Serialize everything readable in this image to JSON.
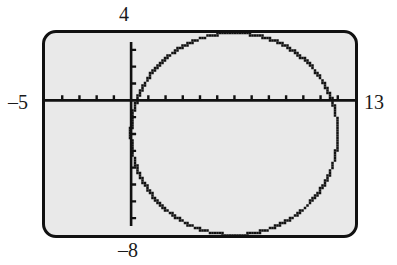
{
  "figure": {
    "kind": "graphing-calculator-screen",
    "screen": {
      "background_color": "#e9e9e9",
      "border_color": "#111111"
    }
  },
  "axis_labels": {
    "xmin": "–5",
    "xmax": "13",
    "ymax": "4",
    "ymin": "–8"
  },
  "chart_data": {
    "type": "scatter",
    "title": "",
    "xlabel": "",
    "ylabel": "",
    "xlim": [
      -5,
      13
    ],
    "ylim": [
      -8,
      4
    ],
    "xtick_step": 1,
    "ytick_step": 1,
    "grid": false,
    "legend": null,
    "axes": {
      "x_axis_at_y": 0,
      "y_axis_at_x": 0,
      "tick_marks": true,
      "tick_length_px": 5
    },
    "series": [
      {
        "name": "circle",
        "type": "circle",
        "center": [
          6,
          -2
        ],
        "radius": 6,
        "stroke": "#111111",
        "rendering": "pixelated-dotted",
        "x_intercepts": [
          0.34,
          11.66
        ],
        "y_intercepts": [
          -2
        ],
        "top_point": [
          6,
          4
        ],
        "bottom_point": [
          6,
          -8
        ],
        "left_point": [
          0,
          -2
        ],
        "right_point": [
          12,
          -2
        ]
      }
    ]
  }
}
